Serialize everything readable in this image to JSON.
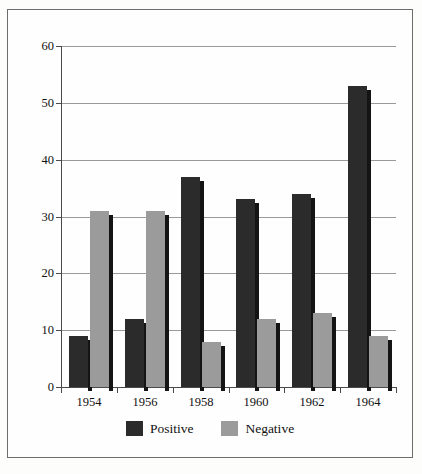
{
  "chart_data": {
    "type": "bar",
    "title": "",
    "xlabel": "",
    "ylabel": "",
    "categories": [
      "1954",
      "1956",
      "1958",
      "1960",
      "1962",
      "1964"
    ],
    "series": [
      {
        "name": "Positive",
        "color": "#2b2b2b",
        "values": [
          9,
          12,
          37,
          33,
          34,
          53
        ]
      },
      {
        "name": "Negative",
        "color": "#9b9b9b",
        "values": [
          31,
          31,
          8,
          12,
          13,
          9
        ]
      }
    ],
    "ylim": [
      0,
      60
    ],
    "yticks": [
      0,
      10,
      20,
      30,
      40,
      50,
      60
    ],
    "ytick_labels": [
      "0",
      "10",
      "20",
      "30",
      "40",
      "50",
      "60"
    ],
    "grid": true,
    "grid_axis": "y",
    "legend": {
      "position": "bottom",
      "entries": [
        {
          "label": "Positive",
          "swatch": "positive"
        },
        {
          "label": "Negative",
          "swatch": "negative"
        }
      ]
    },
    "style": {
      "bar_shadow": true,
      "frame_border": "#6d6d6d",
      "axis_color": "#4a4a4a",
      "gridline_color": "#9a9a9a",
      "background": "#fefefe"
    }
  }
}
